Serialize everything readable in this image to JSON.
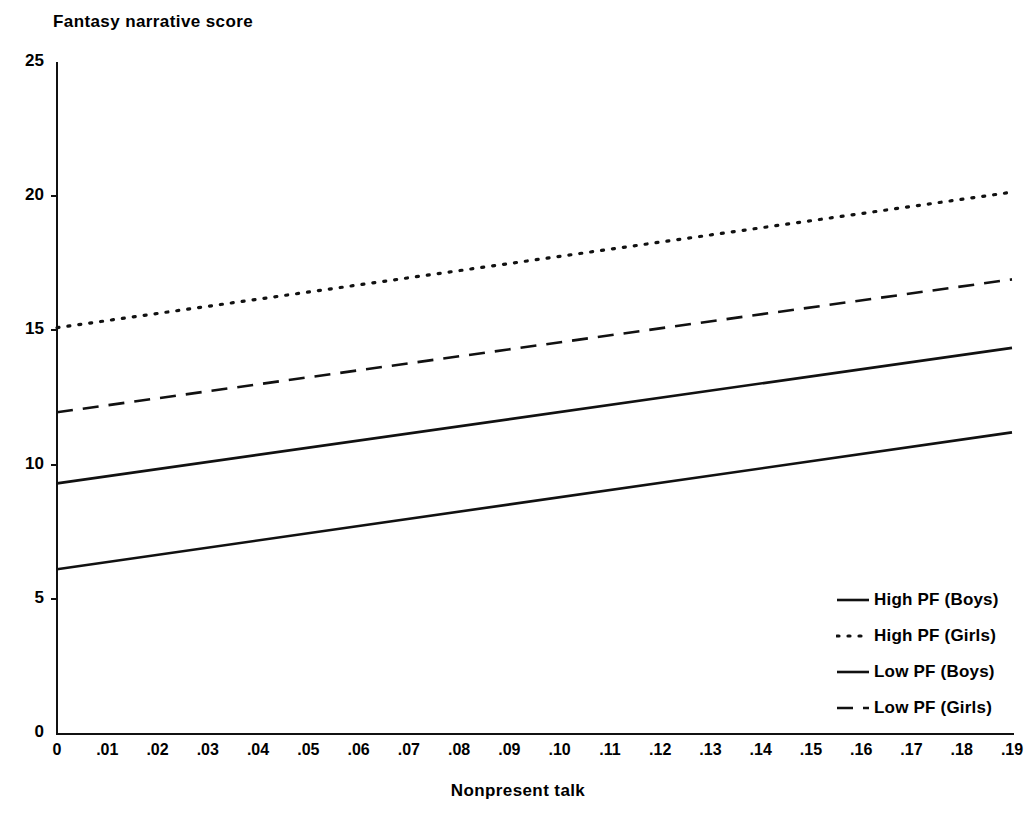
{
  "chart_data": {
    "type": "line",
    "title": "",
    "xlabel": "Nonpresent talk",
    "ylabel": "Fantasy narrative score",
    "xlim": [
      0,
      0.19
    ],
    "ylim": [
      0,
      25
    ],
    "grid": false,
    "legend_position": "right-bottom-inside",
    "x_tick_labels": [
      "0",
      ".01",
      ".02",
      ".03",
      ".04",
      ".05",
      ".06",
      ".07",
      ".08",
      ".09",
      ".10",
      ".11",
      ".12",
      ".13",
      ".14",
      ".15",
      ".16",
      ".17",
      ".18",
      ".19"
    ],
    "x_tick_values": [
      0,
      0.01,
      0.02,
      0.03,
      0.04,
      0.05,
      0.06,
      0.07,
      0.08,
      0.09,
      0.1,
      0.11,
      0.12,
      0.13,
      0.14,
      0.15,
      0.16,
      0.17,
      0.18,
      0.19
    ],
    "y_tick_labels": [
      "0",
      "5",
      "10",
      "15",
      "20",
      "25"
    ],
    "y_tick_values": [
      0,
      5,
      10,
      15,
      20,
      25
    ],
    "x": [
      0,
      0.19
    ],
    "series": [
      {
        "name": "High PF (Boys)",
        "style": "solid",
        "color": "#111111",
        "values": [
          9.3,
          14.35
        ]
      },
      {
        "name": "High PF (Girls)",
        "style": "dotted",
        "color": "#111111",
        "values": [
          15.1,
          20.15
        ]
      },
      {
        "name": "Low PF (Boys)",
        "style": "solid",
        "color": "#111111",
        "values": [
          6.1,
          11.2
        ]
      },
      {
        "name": "Low PF (Girls)",
        "style": "dashed",
        "color": "#111111",
        "values": [
          11.95,
          16.9
        ]
      }
    ]
  },
  "axis": {
    "y_title": "Fantasy narrative score",
    "x_title": "Nonpresent talk"
  },
  "legend": {
    "items": [
      {
        "label": "High PF (Boys)",
        "style": "solid"
      },
      {
        "label": "High PF (Girls)",
        "style": "dotted"
      },
      {
        "label": "Low PF (Boys)",
        "style": "solid"
      },
      {
        "label": "Low PF (Girls)",
        "style": "dashed"
      }
    ]
  }
}
